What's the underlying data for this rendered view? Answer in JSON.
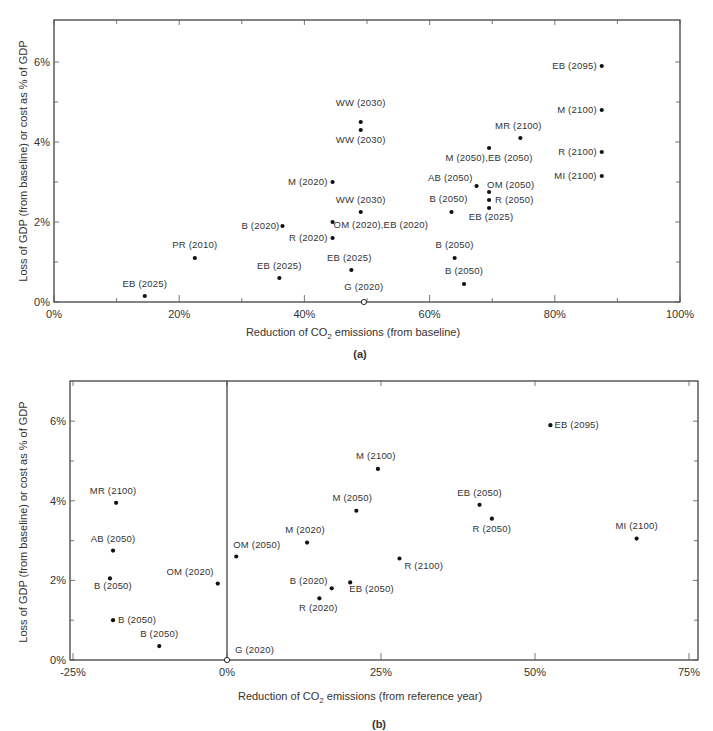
{
  "chart_data": [
    {
      "id": "a",
      "type": "scatter",
      "caption": "(a)",
      "xlabel": "Reduction of CO2 emissions (from baseline)",
      "ylabel": "Loss of GDP (from baseline) or cost as % of GDP",
      "xlim": [
        0,
        100
      ],
      "ylim": [
        0,
        7
      ],
      "x_ticks": [
        "0%",
        "20%",
        "40%",
        "60%",
        "80%",
        "100%"
      ],
      "y_ticks": [
        "0%",
        "2%",
        "4%",
        "6%"
      ],
      "grid": false,
      "points": [
        {
          "label": "EB (2095)",
          "x": 87.5,
          "y": 5.9,
          "lx": -5,
          "ly": 3,
          "anchor": "end"
        },
        {
          "label": "WW (2030)",
          "x": 49,
          "y": 4.5,
          "lx": 0,
          "ly": -16,
          "anchor": "middle"
        },
        {
          "label": "WW (2030)",
          "x": 49,
          "y": 4.3,
          "lx": 0,
          "ly": 13,
          "anchor": "middle"
        },
        {
          "label": "M (2100)",
          "x": 87.5,
          "y": 4.8,
          "lx": -5,
          "ly": 3,
          "anchor": "end"
        },
        {
          "label": "MR (2100)",
          "x": 74.5,
          "y": 4.1,
          "lx": -2,
          "ly": -9,
          "anchor": "middle"
        },
        {
          "label": "M (2050),EB (2050)",
          "x": 69.5,
          "y": 3.85,
          "lx": 0,
          "ly": 13,
          "anchor": "middle"
        },
        {
          "label": "R (2100)",
          "x": 87.5,
          "y": 3.75,
          "lx": -5,
          "ly": 3,
          "anchor": "end"
        },
        {
          "label": "MI (2100)",
          "x": 87.5,
          "y": 3.15,
          "lx": -5,
          "ly": 3,
          "anchor": "end"
        },
        {
          "label": "M (2020)",
          "x": 44.5,
          "y": 3.0,
          "lx": -5,
          "ly": 3,
          "anchor": "end"
        },
        {
          "label": "AB (2050)",
          "x": 67.5,
          "y": 2.9,
          "lx": -4,
          "ly": -5,
          "anchor": "end"
        },
        {
          "label": "OM (2050)",
          "x": 69.5,
          "y": 2.75,
          "lx": -2,
          "ly": -4,
          "anchor": "start"
        },
        {
          "label": "R (2050)",
          "x": 69.5,
          "y": 2.55,
          "lx": 6,
          "ly": 3,
          "anchor": "start"
        },
        {
          "label": "EB (2025)",
          "x": 69.5,
          "y": 2.35,
          "lx": 2,
          "ly": 12,
          "anchor": "middle"
        },
        {
          "label": "B (2050)",
          "x": 63.5,
          "y": 2.25,
          "lx": -3,
          "ly": -10,
          "anchor": "middle"
        },
        {
          "label": "WW (2030)",
          "x": 49,
          "y": 2.25,
          "lx": 0,
          "ly": -9,
          "anchor": "middle"
        },
        {
          "label": "OM (2020),EB (2020)",
          "x": 44.5,
          "y": 2.0,
          "lx": 1,
          "ly": 6,
          "anchor": "start"
        },
        {
          "label": "B (2020)",
          "x": 36.5,
          "y": 1.9,
          "lx": -3,
          "ly": 3,
          "anchor": "end"
        },
        {
          "label": "R (2020)",
          "x": 44.5,
          "y": 1.6,
          "lx": -5,
          "ly": 3,
          "anchor": "end"
        },
        {
          "label": "B (2050)",
          "x": 64,
          "y": 1.1,
          "lx": 0,
          "ly": -10,
          "anchor": "middle"
        },
        {
          "label": "PR (2010)",
          "x": 22.5,
          "y": 1.1,
          "lx": 0,
          "ly": -10,
          "anchor": "middle"
        },
        {
          "label": "EB (2025)",
          "x": 47.5,
          "y": 0.8,
          "lx": -2,
          "ly": -9,
          "anchor": "middle"
        },
        {
          "label": "EB (2025)",
          "x": 36,
          "y": 0.6,
          "lx": 0,
          "ly": -9,
          "anchor": "middle"
        },
        {
          "label": "B (2050)",
          "x": 65.5,
          "y": 0.45,
          "lx": 0,
          "ly": -10,
          "anchor": "middle"
        },
        {
          "label": "EB (2025)",
          "x": 14.5,
          "y": 0.15,
          "lx": 0,
          "ly": -9,
          "anchor": "middle"
        },
        {
          "label": "G (2020)",
          "x": 49.5,
          "y": 0.0,
          "lx": 0,
          "ly": -12,
          "anchor": "middle",
          "open": true
        }
      ]
    },
    {
      "id": "b",
      "type": "scatter",
      "caption": "(b)",
      "xlabel": "Reduction of CO2 emissions (from reference year)",
      "ylabel": "Loss of GDP (from baseline) or cost as % of GDP",
      "xlim": [
        -27,
        77
      ],
      "ylim": [
        0,
        7
      ],
      "x_ticks": [
        "-25%",
        "0%",
        "25%",
        "50%",
        "75%"
      ],
      "y_ticks": [
        "0%",
        "2%",
        "4%",
        "6%"
      ],
      "grid": false,
      "points": [
        {
          "label": "EB (2095)",
          "x": 52.5,
          "y": 5.9,
          "lx": 4,
          "ly": 3,
          "anchor": "start"
        },
        {
          "label": "M (2100)",
          "x": 24.5,
          "y": 4.8,
          "lx": -2,
          "ly": -10,
          "anchor": "middle"
        },
        {
          "label": "MR (2100)",
          "x": -18,
          "y": 3.95,
          "lx": -3,
          "ly": -9,
          "anchor": "middle"
        },
        {
          "label": "EB (2050)",
          "x": 41,
          "y": 3.9,
          "lx": 0,
          "ly": -9,
          "anchor": "middle"
        },
        {
          "label": "M (2050)",
          "x": 21,
          "y": 3.75,
          "lx": -4,
          "ly": -10,
          "anchor": "middle"
        },
        {
          "label": "R (2050)",
          "x": 43,
          "y": 3.55,
          "lx": 0,
          "ly": 13,
          "anchor": "middle"
        },
        {
          "label": "MI (2100)",
          "x": 66.5,
          "y": 3.05,
          "lx": 0,
          "ly": -10,
          "anchor": "middle"
        },
        {
          "label": "M (2020)",
          "x": 13,
          "y": 2.95,
          "lx": -2,
          "ly": -10,
          "anchor": "middle"
        },
        {
          "label": "AB (2050)",
          "x": -18.5,
          "y": 2.75,
          "lx": 0,
          "ly": -9,
          "anchor": "middle"
        },
        {
          "label": "OM (2050)",
          "x": 1.5,
          "y": 2.6,
          "lx": -3,
          "ly": -9,
          "anchor": "start"
        },
        {
          "label": "R (2100)",
          "x": 28,
          "y": 2.55,
          "lx": 5,
          "ly": 10,
          "anchor": "start"
        },
        {
          "label": "B (2050)",
          "x": -19,
          "y": 2.05,
          "lx": 3,
          "ly": 11,
          "anchor": "middle"
        },
        {
          "label": "OM (2020)",
          "x": -1.5,
          "y": 1.92,
          "lx": -4,
          "ly": -9,
          "anchor": "end"
        },
        {
          "label": "EB (2050)",
          "x": 20,
          "y": 1.95,
          "lx": -1,
          "ly": 10,
          "anchor": "start"
        },
        {
          "label": "B (2020)",
          "x": 17,
          "y": 1.8,
          "lx": -4,
          "ly": -4,
          "anchor": "end"
        },
        {
          "label": "R (2020)",
          "x": 15,
          "y": 1.55,
          "lx": -1,
          "ly": 13,
          "anchor": "middle"
        },
        {
          "label": "B (2050)",
          "x": -18.5,
          "y": 1.0,
          "lx": 5,
          "ly": 3,
          "anchor": "start"
        },
        {
          "label": "B (2050)",
          "x": -11,
          "y": 0.35,
          "lx": 0,
          "ly": -9,
          "anchor": "middle"
        },
        {
          "label": "G (2020)",
          "x": 0,
          "y": 0.0,
          "lx": 8,
          "ly": -7,
          "anchor": "start",
          "open": true
        }
      ]
    }
  ]
}
